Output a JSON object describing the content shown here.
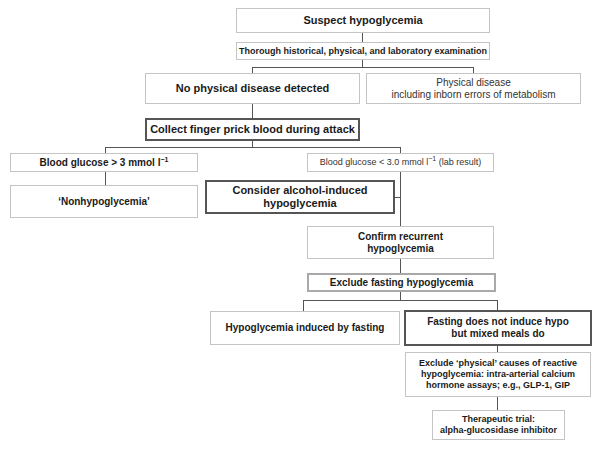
{
  "diagram": {
    "type": "flowchart",
    "title": "Suspect hypoglycemia",
    "nodes": {
      "suspect": {
        "label": "Suspect hypoglycemia"
      },
      "exam": {
        "label": "Thorough historical, physical, and laboratory examination"
      },
      "no_physical": {
        "label": "No physical disease detected"
      },
      "physical": {
        "line1": "Physical disease",
        "line2": "including inborn errors of metabolism"
      },
      "collect": {
        "label": "Collect finger prick blood during attack"
      },
      "bg_high": {
        "prefix": "Blood glucose > 3 mmol l",
        "sup": "−1",
        "suffix": ""
      },
      "nonhypo": {
        "label": "‘Nonhypoglycemia’"
      },
      "bg_low": {
        "prefix": "Blood glucose < 3.0 mmol l",
        "sup": "−1",
        "suffix": " (lab result)"
      },
      "alcohol": {
        "line1": "Consider alcohol-induced",
        "line2": "hypoglycemia"
      },
      "confirm": {
        "line1": "Confirm recurrent",
        "line2": "hypoglycemia"
      },
      "exclude_fasting": {
        "label": "Exclude fasting hypoglycemia"
      },
      "fasting_induced": {
        "label": "Hypoglycemia induced by fasting"
      },
      "mixed_meals": {
        "line1": "Fasting does not induce hypo",
        "line2": "but mixed meals do"
      },
      "exclude_physical": {
        "line1": "Exclude ‘physical’ causes of reactive",
        "line2": "hypoglycemia: intra-arterial calcium",
        "line3": "hormone assays; e.g., GLP-1, GIP"
      },
      "trial": {
        "line1": "Therapeutic trial:",
        "line2": "alpha-glucosidase inhibitor"
      }
    },
    "edges": [
      [
        "suspect",
        "exam"
      ],
      [
        "exam",
        "no_physical"
      ],
      [
        "exam",
        "physical"
      ],
      [
        "no_physical",
        "collect"
      ],
      [
        "collect",
        "bg_high"
      ],
      [
        "collect",
        "bg_low"
      ],
      [
        "bg_high",
        "nonhypo"
      ],
      [
        "bg_low",
        "alcohol"
      ],
      [
        "bg_low",
        "confirm"
      ],
      [
        "confirm",
        "exclude_fasting"
      ],
      [
        "exclude_fasting",
        "fasting_induced"
      ],
      [
        "exclude_fasting",
        "mixed_meals"
      ],
      [
        "mixed_meals",
        "exclude_physical"
      ],
      [
        "exclude_physical",
        "trial"
      ]
    ],
    "colors": {
      "line": "#555555",
      "box_border": "#c4c4c4",
      "emphasis_border": "#555555",
      "text": "#1a1a1a"
    }
  }
}
